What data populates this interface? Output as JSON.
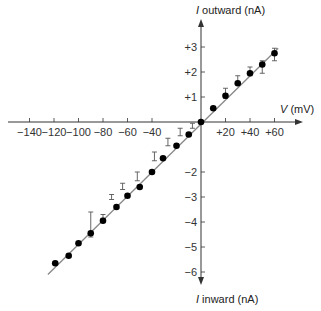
{
  "chart_data": {
    "type": "scatter",
    "title": "",
    "xlabel": "V (mV)",
    "ylabel_top": "I outward (nA)",
    "ylabel_bottom": "I inward (nA)",
    "xlim": [
      -145,
      70
    ],
    "ylim": [
      -6.7,
      3.7
    ],
    "grid": false,
    "legend": null,
    "x_ticks": [
      {
        "value": -140,
        "label": "−140"
      },
      {
        "value": -120,
        "label": "−120"
      },
      {
        "value": -100,
        "label": "−100"
      },
      {
        "value": -80,
        "label": "−80"
      },
      {
        "value": -60,
        "label": "−60"
      },
      {
        "value": -40,
        "label": "−40"
      },
      {
        "value": 20,
        "label": "+20"
      },
      {
        "value": 40,
        "label": "+40"
      },
      {
        "value": 60,
        "label": "+60"
      }
    ],
    "y_ticks": [
      {
        "value": 3,
        "label": "+3"
      },
      {
        "value": 2,
        "label": "+2"
      },
      {
        "value": 1,
        "label": "+1"
      },
      {
        "value": -2,
        "label": "−2"
      },
      {
        "value": -3,
        "label": "−3"
      },
      {
        "value": -4,
        "label": "−4"
      },
      {
        "value": -5,
        "label": "−5"
      },
      {
        "value": -6,
        "label": "−6"
      }
    ],
    "series": [
      {
        "name": "measured current",
        "marker": "filled-circle",
        "points": [
          {
            "x": -119,
            "y": -5.65
          },
          {
            "x": -108,
            "y": -5.35
          },
          {
            "x": -100,
            "y": -4.85
          },
          {
            "x": -90,
            "y": -4.45
          },
          {
            "x": -80,
            "y": -3.95
          },
          {
            "x": -69,
            "y": -3.4
          },
          {
            "x": -60,
            "y": -2.95
          },
          {
            "x": -50,
            "y": -2.6
          },
          {
            "x": -40,
            "y": -2.0
          },
          {
            "x": -31,
            "y": -1.45
          },
          {
            "x": -20,
            "y": -0.95
          },
          {
            "x": -10,
            "y": -0.5
          },
          {
            "x": 0,
            "y": 0
          },
          {
            "x": 10,
            "y": 0.55
          },
          {
            "x": 20,
            "y": 1.05
          },
          {
            "x": 30,
            "y": 1.55
          },
          {
            "x": 40,
            "y": 1.95
          },
          {
            "x": 50,
            "y": 2.3
          },
          {
            "x": 60,
            "y": 2.75
          }
        ]
      },
      {
        "name": "error bars (offset)",
        "marker": "error-bar",
        "bars": [
          {
            "x": -90,
            "low": -4.6,
            "high": -3.6
          },
          {
            "x": -80,
            "low": -3.85,
            "high": -3.7
          },
          {
            "x": -73,
            "low": -3.1,
            "high": -2.9
          },
          {
            "x": -64,
            "low": -2.7,
            "high": -2.45
          },
          {
            "x": -52,
            "low": -2.35,
            "high": -2.0
          },
          {
            "x": -38,
            "low": -1.55,
            "high": -1.2
          },
          {
            "x": -27,
            "low": -0.95,
            "high": -0.65
          },
          {
            "x": -17,
            "low": -0.55,
            "high": -0.25
          },
          {
            "x": -7,
            "low": -0.25,
            "high": -0.05
          },
          {
            "x": 20,
            "low": 0.95,
            "high": 1.35
          },
          {
            "x": 30,
            "low": 1.5,
            "high": 1.85
          },
          {
            "x": 40,
            "low": 1.85,
            "high": 2.2
          },
          {
            "x": 50,
            "low": 1.95,
            "high": 2.45
          },
          {
            "x": 60,
            "low": 2.45,
            "high": 2.95
          }
        ]
      },
      {
        "name": "linear fit",
        "type": "line",
        "points": [
          {
            "x": -125,
            "y": -6.1
          },
          {
            "x": 63,
            "y": 2.95
          }
        ]
      }
    ]
  },
  "axis_labels": {
    "x_prefix": "V",
    "x_unit": " (mV)",
    "y_top_prefix": "I",
    "y_top_rest": " outward (nA)",
    "y_bottom_prefix": "I",
    "y_bottom_rest": " inward (nA)"
  },
  "colors": {
    "axis": "#333333",
    "points": "#000000",
    "fit_line": "#888888",
    "error_bars": "#555555"
  }
}
